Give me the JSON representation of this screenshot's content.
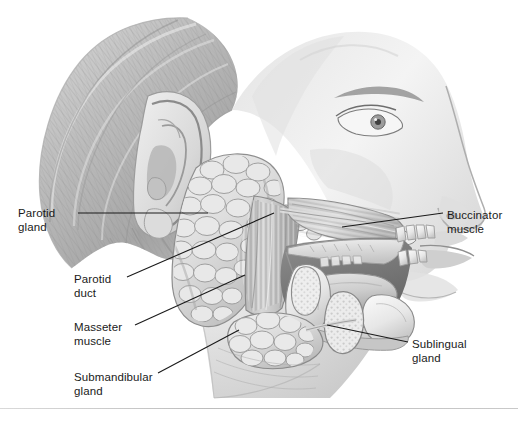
{
  "figure": {
    "style": "grayscale pencil medical illustration",
    "background_color": "#ffffff",
    "leader_line_color": "#1a1a1a",
    "label_text_color": "#1a1a1a"
  },
  "labels": [
    {
      "id": "parotid-gland",
      "text": "Parotid\ngland",
      "side": "left",
      "x": 18,
      "y": 206,
      "leader": {
        "x1": 78,
        "y1": 213,
        "x2": 208,
        "y2": 213
      }
    },
    {
      "id": "parotid-duct",
      "text": "Parotid\nduct",
      "side": "left",
      "x": 74,
      "y": 272,
      "leader": {
        "x1": 127,
        "y1": 277,
        "x2": 274,
        "y2": 213
      }
    },
    {
      "id": "masseter-muscle",
      "text": "Masseter\nmuscle",
      "side": "left",
      "x": 74,
      "y": 320,
      "leader": {
        "x1": 135,
        "y1": 325,
        "x2": 245,
        "y2": 275
      }
    },
    {
      "id": "submandibular-gland",
      "text": "Submandibular\ngland",
      "side": "left",
      "x": 74,
      "y": 370,
      "leader": {
        "x1": 158,
        "y1": 373,
        "x2": 239,
        "y2": 330
      }
    },
    {
      "id": "buccinator-muscle",
      "text": "Buccinator\nmuscle",
      "side": "right",
      "x": 447,
      "y": 208,
      "leader": {
        "x1": 443,
        "y1": 213,
        "x2": 342,
        "y2": 227
      }
    },
    {
      "id": "sublingual-gland",
      "text": "Sublingual\ngland",
      "side": "right",
      "x": 412,
      "y": 337,
      "leader": {
        "x1": 408,
        "y1": 342,
        "x2": 327,
        "y2": 325
      }
    }
  ],
  "anatomy": {
    "parotid_gland": "large lobulated gland anterior-inferior to the ear",
    "parotid_duct": "duct crossing the masseter toward the cheek",
    "masseter_muscle": "vertically striated muscle over the ramus of mandible",
    "submandibular_gland": "lobulated gland below the mandible angle",
    "buccinator_muscle": "cheek muscle fibers running to the mouth angle",
    "sublingual_gland": "small stippled gland in floor of mouth",
    "other_structures": [
      "ear (auricle)",
      "hair",
      "eye",
      "nose",
      "lips",
      "upper teeth",
      "lower teeth",
      "hard palate",
      "tongue",
      "mandible"
    ]
  }
}
